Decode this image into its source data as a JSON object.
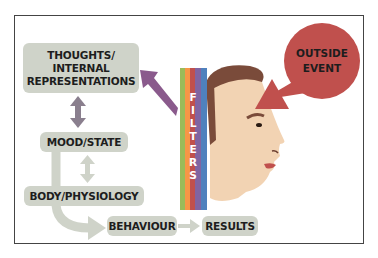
{
  "diagram": {
    "nodes": {
      "thoughts": {
        "label": "THOUGHTS/\nINTERNAL\nREPRESENTATIONS"
      },
      "mood": {
        "label": "MOOD/STATE"
      },
      "body": {
        "label": "BODY/PHYSIOLOGY"
      },
      "behaviour": {
        "label": "BEHAVIOUR"
      },
      "results": {
        "label": "RESULTS"
      },
      "outside_event": {
        "line1": "OUTSIDE",
        "line2": "EVENT"
      }
    },
    "filters": {
      "letters": [
        "F",
        "I",
        "L",
        "T",
        "E",
        "R",
        "S"
      ]
    },
    "colors": {
      "box_fill": "#cfd3c9",
      "bubble": "#c0504d",
      "arrow_purple": "#8a5a8c",
      "arrow_light": "#cfd3c9",
      "skin": "#f2d3b3",
      "hair": "#7a4b3a",
      "filter_stripes": [
        "#9bbb59",
        "#f79646",
        "#c0504d",
        "#8064a2",
        "#4f81bd"
      ]
    },
    "edges": [
      {
        "from": "thoughts",
        "to": "mood",
        "type": "bidirectional"
      },
      {
        "from": "mood",
        "to": "body",
        "type": "bidirectional"
      },
      {
        "from": "mood",
        "to": "behaviour",
        "type": "curved"
      },
      {
        "from": "behaviour",
        "to": "results",
        "type": "directed"
      },
      {
        "from": "filters",
        "to": "thoughts",
        "type": "directed"
      },
      {
        "from": "outside_event",
        "to": "head",
        "type": "speech-pointer"
      }
    ]
  }
}
